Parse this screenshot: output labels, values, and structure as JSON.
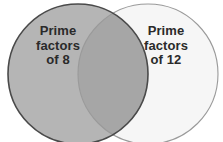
{
  "diagram": {
    "type": "venn-diagram",
    "background_color": "#ffffff",
    "sets": [
      {
        "id": "left",
        "name": "prime-factors-of-8",
        "label_lines": [
          "Prime",
          "factors",
          "of 8"
        ],
        "fill_color": "#b5b5b5",
        "stroke_color": "#4a4a4a",
        "stroke_width": 1.6,
        "center_x": 78,
        "center_y": 74,
        "radius": 70
      },
      {
        "id": "right",
        "name": "prime-factors-of-12",
        "label_lines": [
          "Prime",
          "factors",
          "of 12"
        ],
        "fill_color": "#f6f6f6",
        "stroke_color": "#9a9a9a",
        "stroke_width": 1.1,
        "center_x": 148,
        "center_y": 74,
        "radius": 70
      }
    ],
    "intersection": {
      "name": "common-prime-factors",
      "fill_color": "#a6a6a6",
      "label": ""
    },
    "text_color": "#2a2a2a"
  }
}
